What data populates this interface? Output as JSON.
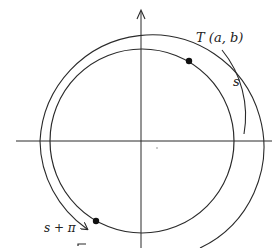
{
  "diagram": {
    "type": "unit-circle-arc-length",
    "labels": {
      "point_t": "T (a, b)",
      "arc_s": "s",
      "arc_s_plus_pi": "s + π"
    },
    "colors": {
      "stroke": "#2a2a2a",
      "background": "#ffffff"
    },
    "elements": [
      {
        "name": "x-axis",
        "kind": "line"
      },
      {
        "name": "y-axis",
        "kind": "line with arrow"
      },
      {
        "name": "unit-circle",
        "kind": "circle"
      },
      {
        "name": "point-t",
        "kind": "dot",
        "label": "T (a, b)"
      },
      {
        "name": "point-s-plus-pi",
        "kind": "dot"
      },
      {
        "name": "arc-s",
        "kind": "arc",
        "label": "s"
      },
      {
        "name": "arc-s-plus-pi",
        "kind": "arc with arrow",
        "label": "s + π"
      }
    ]
  }
}
